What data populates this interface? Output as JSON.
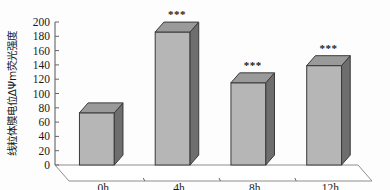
{
  "chart_data": {
    "type": "bar",
    "title": "",
    "subtitle": "",
    "xlabel": "",
    "ylabel": "线粒体膜电位ΔΨm荧光强度",
    "categories": [
      "0h",
      "4h",
      "8h",
      "12h"
    ],
    "values": [
      73,
      186,
      115,
      139
    ],
    "annotations": [
      "",
      "***",
      "***",
      "***"
    ],
    "ylim": [
      0,
      200
    ],
    "yticks": [
      0,
      20,
      40,
      60,
      80,
      100,
      120,
      140,
      160,
      180,
      200
    ],
    "ytick_labels": [
      "0",
      "20",
      "40",
      "60",
      "80",
      "100",
      "120",
      "140",
      "160",
      "180",
      "200"
    ],
    "grid": false,
    "legend": null,
    "style": "3d-column",
    "colors": {
      "bar_front": "#b6b6b6",
      "bar_side": "#6e6e6e",
      "bar_top": "#9a9a9a",
      "bar_edge": "#3a3a3a",
      "axis": "#555555",
      "floor": "#8d8d8d",
      "text": "#1a1a1a",
      "background": "#fdfdfd"
    }
  },
  "axis": {
    "y_title": "线粒体膜电位ΔΨm荧光强度"
  }
}
